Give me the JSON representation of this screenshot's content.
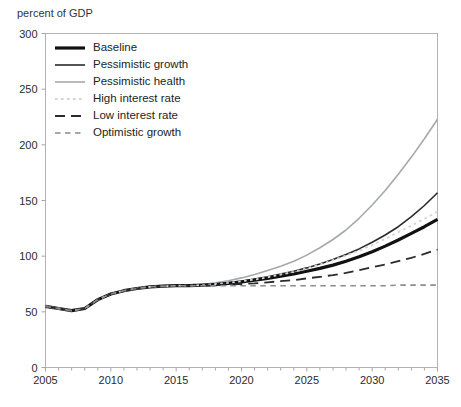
{
  "title": "percent of GDP",
  "colors": {
    "background": "#ffffff",
    "frame": "#b3b3b3",
    "tick": "#a6a6a6",
    "label_text": "#2b2b2b",
    "title_text": "#333333"
  },
  "axes": {
    "x": {
      "min": 2005,
      "max": 2035,
      "major_tick_labels": [
        "2005",
        "2010",
        "2015",
        "2020",
        "2025",
        "2030",
        "2035"
      ],
      "minor_tick_step": 1
    },
    "y": {
      "min": 0,
      "max": 300,
      "tick_step": 50,
      "tick_labels": [
        "0",
        "50",
        "100",
        "150",
        "200",
        "250",
        "300"
      ]
    }
  },
  "chart_data": {
    "type": "line",
    "title": "percent of GDP",
    "xlabel": "",
    "ylabel": "percent of GDP",
    "xlim": [
      2005,
      2035
    ],
    "ylim": [
      0,
      300
    ],
    "grid": false,
    "legend_position": "top-left-inside",
    "x": [
      2005,
      2006,
      2007,
      2008,
      2009,
      2010,
      2011,
      2012,
      2013,
      2014,
      2015,
      2016,
      2017,
      2018,
      2019,
      2020,
      2021,
      2022,
      2023,
      2024,
      2025,
      2026,
      2027,
      2028,
      2029,
      2030,
      2031,
      2032,
      2033,
      2034,
      2035
    ],
    "series": [
      {
        "name": "Baseline",
        "color": "#111111",
        "width": 3.2,
        "dash": "solid",
        "values": [
          55,
          53,
          51,
          53,
          61,
          66,
          69,
          71,
          72.5,
          73,
          73.5,
          73.5,
          74,
          74.5,
          75.5,
          77,
          78.5,
          80,
          82,
          84,
          86.5,
          89,
          92,
          95.5,
          99.5,
          104,
          109,
          114.5,
          120.5,
          126.5,
          133
        ]
      },
      {
        "name": "Pessimistic growth",
        "color": "#2b2b2b",
        "width": 1.6,
        "dash": "solid",
        "values": [
          55,
          53,
          51,
          53,
          61,
          66,
          69,
          71,
          72.5,
          73,
          73.5,
          73.5,
          74,
          75,
          76,
          77.5,
          79.5,
          81.5,
          84,
          86.5,
          89.5,
          93,
          97,
          101.5,
          106.5,
          112.5,
          119,
          126.5,
          135.5,
          145.5,
          157
        ]
      },
      {
        "name": "Pessimistic health",
        "color": "#a6a8ab",
        "width": 1.6,
        "dash": "solid",
        "values": [
          55,
          53,
          51,
          53,
          61,
          66,
          69,
          71,
          72.5,
          73,
          73.5,
          73.5,
          74.5,
          76,
          78,
          80.5,
          83.5,
          87,
          91,
          95.5,
          101,
          107.5,
          115,
          123.5,
          134,
          146,
          159,
          173.5,
          189,
          205.5,
          223
        ]
      },
      {
        "name": "High interest rate",
        "color": "#d2d4d5",
        "width": 1.8,
        "dash": "dotted",
        "values": [
          55,
          53,
          51,
          53,
          61,
          66,
          69,
          71,
          72.5,
          73,
          73.5,
          73.5,
          74,
          75,
          76,
          77.5,
          79,
          81,
          83.5,
          86,
          89,
          92.5,
          96.5,
          100.5,
          105,
          110,
          115.5,
          121.5,
          127.5,
          133.5,
          140
        ]
      },
      {
        "name": "Low interest rate",
        "color": "#2b2b2b",
        "width": 1.8,
        "dash": "long-dash",
        "values": [
          55,
          53,
          51,
          53,
          61,
          66,
          69,
          71,
          72.5,
          73,
          73.5,
          73.5,
          73.5,
          74,
          74.5,
          75,
          75.5,
          76.5,
          77.5,
          78.5,
          80,
          81.5,
          83,
          85,
          87.5,
          90,
          92.5,
          95.5,
          98.5,
          102,
          106
        ]
      },
      {
        "name": "Optimistic growth",
        "color": "#8a8c8f",
        "width": 1.6,
        "dash": "short-dash",
        "values": [
          55,
          53,
          51,
          53,
          61,
          66,
          69,
          71,
          72.5,
          73,
          73.5,
          73.5,
          73.5,
          73.5,
          73.5,
          73.5,
          73.5,
          73.5,
          73.5,
          73.5,
          73.5,
          73.5,
          73.5,
          73.5,
          73.5,
          73.5,
          73.5,
          74,
          74,
          74,
          74
        ]
      }
    ]
  }
}
